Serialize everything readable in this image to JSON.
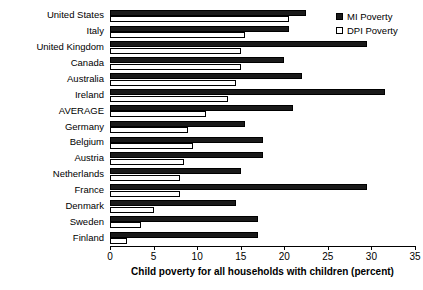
{
  "chart_data": {
    "type": "bar",
    "orientation": "horizontal",
    "title": "",
    "xlabel": "Child poverty for all households with children (percent)",
    "ylabel": "",
    "xlim": [
      0,
      35
    ],
    "xticks": [
      0,
      5,
      10,
      15,
      20,
      25,
      30,
      35
    ],
    "xtick_labels": [
      "0",
      "5",
      "10",
      "15",
      "20",
      "25",
      "30",
      "35"
    ],
    "grid": false,
    "legend_position": "top-right",
    "categories": [
      "United States",
      "Italy",
      "United Kingdom",
      "Canada",
      "Australia",
      "Ireland",
      "AVERAGE",
      "Germany",
      "Belgium",
      "Austria",
      "Netherlands",
      "France",
      "Denmark",
      "Sweden",
      "Finland"
    ],
    "series": [
      {
        "name": "MI Poverty",
        "color": "#1a1a1a",
        "values": [
          22.5,
          20.5,
          29.5,
          20.0,
          22.0,
          31.5,
          21.0,
          15.5,
          17.5,
          17.5,
          15.0,
          29.5,
          14.5,
          17.0,
          17.0
        ]
      },
      {
        "name": "DPI Poverty",
        "color": "#ffffff",
        "values": [
          20.5,
          15.5,
          15.0,
          15.0,
          14.5,
          13.5,
          11.0,
          9.0,
          9.5,
          8.5,
          8.0,
          8.0,
          5.0,
          3.5,
          2.0
        ]
      }
    ]
  },
  "legend": {
    "entries": [
      {
        "label": "MI Poverty",
        "marker": "filled-square-icon"
      },
      {
        "label": "DPI Poverty",
        "marker": "open-square-icon"
      }
    ]
  },
  "axis": {
    "x_title": "Child poverty for all households with children (percent)"
  }
}
